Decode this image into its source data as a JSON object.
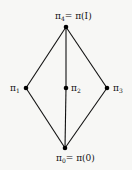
{
  "diagram": {
    "type": "lattice (Hasse diagram)",
    "nodes": [
      {
        "id": "pi4",
        "label": "π",
        "sub": "4",
        "suffix": "= π(I)",
        "x": 66,
        "y": 27
      },
      {
        "id": "pi1",
        "label": "π",
        "sub": "1",
        "suffix": "",
        "x": 26,
        "y": 88
      },
      {
        "id": "pi2",
        "label": "π",
        "sub": "2",
        "suffix": "",
        "x": 66,
        "y": 88
      },
      {
        "id": "pi3",
        "label": "π",
        "sub": "3",
        "suffix": "",
        "x": 107,
        "y": 88
      },
      {
        "id": "pi0",
        "label": "π",
        "sub": "0",
        "suffix": "= π(0)",
        "x": 65,
        "y": 148
      }
    ],
    "edges": [
      [
        "pi4",
        "pi1"
      ],
      [
        "pi4",
        "pi2"
      ],
      [
        "pi4",
        "pi3"
      ],
      [
        "pi1",
        "pi0"
      ],
      [
        "pi2",
        "pi0"
      ],
      [
        "pi3",
        "pi0"
      ]
    ],
    "colors": {
      "line": "#111111",
      "node": "#000000",
      "background": "#f7f7f5"
    }
  },
  "labels": {
    "top": {
      "main": "π",
      "sub": "4",
      "rest": "= π(I)"
    },
    "left": {
      "main": "π",
      "sub": "1"
    },
    "middle": {
      "main": "π",
      "sub": "2"
    },
    "right": {
      "main": "π",
      "sub": "3"
    },
    "bottom": {
      "main": "π",
      "sub": "0",
      "rest": "= π(0)"
    }
  }
}
